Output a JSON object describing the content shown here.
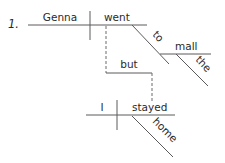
{
  "diagram": {
    "item_number": "1.",
    "words": {
      "subject1": "Genna",
      "verb1": "went",
      "preposition": "to",
      "object_of_prep": "mall",
      "article": "the",
      "conjunction": "but",
      "subject2": "I",
      "verb2": "stayed",
      "adverb": "home"
    },
    "colors": {
      "line": "#5a5a5a",
      "text": "#2a2a2a"
    }
  }
}
